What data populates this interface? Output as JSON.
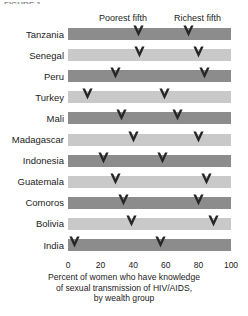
{
  "figure": {
    "top_cut_label": "FIGURE 1",
    "header_annotations": {
      "poorest": "Poorest fifth",
      "richest": "Richest fifth"
    },
    "caption_lines": [
      "Percent of women who have knowledge",
      "of sexual transmission of HIV/AIDS,",
      "by wealth group"
    ],
    "colors": {
      "band_dark": "#8c8c8c",
      "band_light": "#c9c9c9",
      "marker": "#262626",
      "gridline": "#ffffff",
      "background": "#ffffff"
    }
  },
  "chart_data": {
    "type": "scatter",
    "title": "",
    "subtitle": "",
    "xlabel": "Percent of women who have knowledge of sexual transmission of HIV/AIDS, by wealth group",
    "ylabel": "",
    "xlim": [
      0,
      100
    ],
    "xticks": [
      0,
      20,
      40,
      60,
      80,
      100
    ],
    "xtick_labels": [
      "0",
      "20",
      "40",
      "60",
      "80",
      "100"
    ],
    "grid": true,
    "grid_axis": "x",
    "legend_position": "top-inline-annotation",
    "orientation": "horizontal",
    "marker_style": "down-chevron",
    "categories": [
      "Tanzania",
      "Senegal",
      "Peru",
      "Turkey",
      "Mali",
      "Madagascar",
      "Indonesia",
      "Guatemala",
      "Comoros",
      "Bolivia",
      "India"
    ],
    "series": [
      {
        "name": "Poorest fifth",
        "values": [
          43,
          44,
          29,
          12,
          33,
          40,
          22,
          29,
          34,
          39,
          4
        ]
      },
      {
        "name": "Richest fifth",
        "values": [
          74,
          80,
          84,
          59,
          67,
          80,
          58,
          85,
          80,
          89,
          57
        ]
      }
    ]
  }
}
